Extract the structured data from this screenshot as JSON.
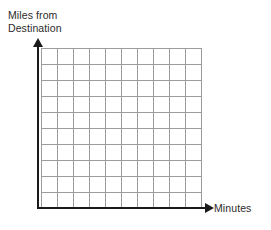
{
  "chart_data": {
    "type": "line",
    "title": "",
    "subtitle": "",
    "xlabel": "Minutes",
    "ylabel": "Miles from\nDestination",
    "ylabel_line1": "Miles from",
    "ylabel_line2": "Destination",
    "series": [],
    "x": [],
    "categories": [],
    "values": [],
    "annotations": [],
    "legend": [],
    "legend_position": "none",
    "grid": true,
    "grid_columns": 10,
    "grid_rows": 10,
    "xlim": [
      0,
      10
    ],
    "ylim": [
      0,
      10
    ],
    "xticklabels": [],
    "yticklabels": [],
    "axis_arrows": true,
    "colors": {
      "background": "#ffffff",
      "grid_line": "#9c9c9c",
      "axis_line": "#1a1a1a",
      "label_text": "#2b2b2b"
    }
  },
  "axes": {
    "x": {
      "label": "Minutes",
      "arrow_icon": "arrow-right-icon"
    },
    "y": {
      "label_line1": "Miles from",
      "label_line2": "Destination",
      "arrow_icon": "arrow-up-icon"
    }
  }
}
